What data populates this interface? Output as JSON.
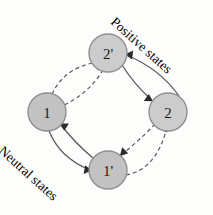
{
  "figure": {
    "background_color": "#fdfdfc",
    "node_fill": "#cccccc",
    "node_stroke": "#8f8f8f",
    "edge_color": "#5a5a5a"
  },
  "nodes": [
    {
      "id": "two-prime",
      "label": "2'",
      "cx": 108,
      "cy": 53,
      "r": 19,
      "shade": "light"
    },
    {
      "id": "one",
      "label": "1",
      "cx": 47,
      "cy": 112,
      "r": 19,
      "shade": "dark"
    },
    {
      "id": "two",
      "label": "2",
      "cx": 168,
      "cy": 112,
      "r": 19,
      "shade": "light"
    },
    {
      "id": "one-prime",
      "label": "1'",
      "cx": 108,
      "cy": 170,
      "r": 19,
      "shade": "dark"
    }
  ],
  "edges": [
    {
      "id": "two-prime-to-one",
      "from": "2'",
      "to": "1",
      "style": "dashed"
    },
    {
      "id": "one-to-two-prime",
      "from": "1",
      "to": "2'",
      "style": "dashed"
    },
    {
      "id": "two-prime-to-two",
      "from": "2'",
      "to": "2",
      "style": "solid"
    },
    {
      "id": "two-to-two-prime",
      "from": "2",
      "to": "2'",
      "style": "solid"
    },
    {
      "id": "two-to-one-prime",
      "from": "2",
      "to": "1'",
      "style": "dashed"
    },
    {
      "id": "one-prime-to-two",
      "from": "1'",
      "to": "2",
      "style": "dashed"
    },
    {
      "id": "one-to-one-prime",
      "from": "1",
      "to": "1'",
      "style": "solid"
    },
    {
      "id": "one-prime-to-one",
      "from": "1'",
      "to": "1",
      "style": "solid"
    }
  ],
  "annotations": {
    "positive_states": "Positive states",
    "neutral_states": "Neutral states"
  }
}
